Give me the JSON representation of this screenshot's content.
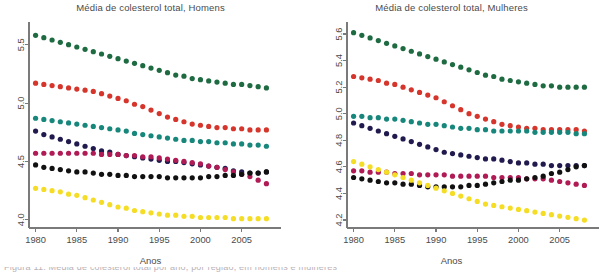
{
  "figure": {
    "background_color": "#ffffff",
    "text_color": "#4a4a4a"
  },
  "footer": {
    "cropped_caption": "Figura 11: Média de colesterol total por ano, por região, em homens e mulheres"
  },
  "panels": {
    "left": {
      "title": "Média de colesterol total, Homens",
      "xlabel": "Anos"
    },
    "right": {
      "title": "Média de colesterol total, Mulheres",
      "xlabel": "Anos"
    }
  },
  "chart_data": [
    {
      "type": "scatter",
      "panel": "left",
      "title": "Média de colesterol total, Homens",
      "xlabel": "Anos",
      "ylabel": "",
      "xlim": [
        1979.2,
        2008.8
      ],
      "ylim": [
        3.93,
        5.66
      ],
      "xticks": [
        1980,
        1985,
        1990,
        1995,
        2000,
        2005
      ],
      "yticks": [
        4.0,
        4.5,
        5.0,
        5.5
      ],
      "grid": false,
      "legend": "none",
      "marker": "filled-circle",
      "x": [
        1980,
        1981,
        1982,
        1983,
        1984,
        1985,
        1986,
        1987,
        1988,
        1989,
        1990,
        1991,
        1992,
        1993,
        1994,
        1995,
        1996,
        1997,
        1998,
        1999,
        2000,
        2001,
        2002,
        2003,
        2004,
        2005,
        2006,
        2007,
        2008
      ],
      "series": [
        {
          "name": "serie-verde-escuro",
          "color": "#1e6b42",
          "values": [
            5.58,
            5.56,
            5.54,
            5.52,
            5.5,
            5.48,
            5.46,
            5.44,
            5.42,
            5.4,
            5.38,
            5.36,
            5.34,
            5.32,
            5.3,
            5.28,
            5.26,
            5.24,
            5.23,
            5.21,
            5.2,
            5.19,
            5.18,
            5.17,
            5.16,
            5.16,
            5.15,
            5.14,
            5.13
          ]
        },
        {
          "name": "serie-vermelho",
          "color": "#d6352b",
          "values": [
            5.17,
            5.16,
            5.15,
            5.14,
            5.13,
            5.12,
            5.11,
            5.1,
            5.08,
            5.06,
            5.04,
            5.02,
            4.99,
            4.97,
            4.94,
            4.91,
            4.88,
            4.86,
            4.84,
            4.82,
            4.81,
            4.8,
            4.79,
            4.79,
            4.78,
            4.78,
            4.77,
            4.77,
            4.77
          ]
        },
        {
          "name": "serie-verde-agua",
          "color": "#17877c",
          "values": [
            4.87,
            4.86,
            4.85,
            4.84,
            4.83,
            4.82,
            4.81,
            4.8,
            4.79,
            4.78,
            4.77,
            4.76,
            4.74,
            4.73,
            4.72,
            4.71,
            4.7,
            4.69,
            4.68,
            4.68,
            4.67,
            4.67,
            4.66,
            4.66,
            4.65,
            4.65,
            4.64,
            4.64,
            4.63
          ]
        },
        {
          "name": "serie-azul-marinho",
          "color": "#211a4e",
          "values": [
            4.76,
            4.73,
            4.71,
            4.69,
            4.67,
            4.65,
            4.63,
            4.61,
            4.59,
            4.58,
            4.56,
            4.55,
            4.54,
            4.53,
            4.52,
            4.51,
            4.5,
            4.5,
            4.49,
            4.48,
            4.47,
            4.46,
            4.45,
            4.44,
            4.42,
            4.41,
            4.4,
            4.4,
            4.41
          ]
        },
        {
          "name": "serie-magenta",
          "color": "#b01b55",
          "values": [
            4.57,
            4.57,
            4.57,
            4.57,
            4.57,
            4.57,
            4.57,
            4.57,
            4.56,
            4.56,
            4.56,
            4.55,
            4.55,
            4.54,
            4.54,
            4.53,
            4.52,
            4.51,
            4.5,
            4.49,
            4.48,
            4.46,
            4.45,
            4.43,
            4.41,
            4.39,
            4.37,
            4.34,
            4.31
          ]
        },
        {
          "name": "serie-preto",
          "color": "#111111",
          "values": [
            4.47,
            4.45,
            4.44,
            4.43,
            4.42,
            4.41,
            4.41,
            4.4,
            4.39,
            4.39,
            4.38,
            4.38,
            4.37,
            4.37,
            4.37,
            4.37,
            4.36,
            4.36,
            4.36,
            4.36,
            4.36,
            4.37,
            4.37,
            4.38,
            4.38,
            4.39,
            4.4,
            4.4,
            4.41
          ]
        },
        {
          "name": "serie-amarelo",
          "color": "#f5dd25",
          "values": [
            4.27,
            4.26,
            4.25,
            4.24,
            4.22,
            4.21,
            4.19,
            4.17,
            4.15,
            4.13,
            4.11,
            4.1,
            4.08,
            4.07,
            4.06,
            4.05,
            4.04,
            4.04,
            4.03,
            4.03,
            4.02,
            4.02,
            4.02,
            4.02,
            4.01,
            4.01,
            4.01,
            4.01,
            4.01
          ]
        }
      ]
    },
    {
      "type": "scatter",
      "panel": "right",
      "title": "Média de colesterol total, Mulheres",
      "xlabel": "Anos",
      "ylabel": "",
      "xlim": [
        1979.2,
        2008.8
      ],
      "ylim": [
        4.14,
        5.66
      ],
      "xticks": [
        1980,
        1985,
        1990,
        1995,
        2000,
        2005
      ],
      "yticks": [
        4.2,
        4.4,
        4.6,
        4.8,
        5.0,
        5.2,
        5.4,
        5.6
      ],
      "grid": false,
      "legend": "none",
      "marker": "filled-circle",
      "x": [
        1980,
        1981,
        1982,
        1983,
        1984,
        1985,
        1986,
        1987,
        1988,
        1989,
        1990,
        1991,
        1992,
        1993,
        1994,
        1995,
        1996,
        1997,
        1998,
        1999,
        2000,
        2001,
        2002,
        2003,
        2004,
        2005,
        2006,
        2007,
        2008
      ],
      "series": [
        {
          "name": "serie-verde-escuro",
          "color": "#1e6b42",
          "values": [
            5.61,
            5.59,
            5.57,
            5.55,
            5.53,
            5.51,
            5.49,
            5.47,
            5.45,
            5.43,
            5.41,
            5.39,
            5.37,
            5.35,
            5.33,
            5.31,
            5.29,
            5.28,
            5.26,
            5.25,
            5.24,
            5.23,
            5.22,
            5.21,
            5.21,
            5.2,
            5.2,
            5.2,
            5.2
          ]
        },
        {
          "name": "serie-vermelho",
          "color": "#d6352b",
          "values": [
            5.28,
            5.27,
            5.26,
            5.25,
            5.23,
            5.22,
            5.2,
            5.18,
            5.16,
            5.14,
            5.12,
            5.09,
            5.06,
            5.03,
            5.0,
            4.98,
            4.96,
            4.94,
            4.92,
            4.91,
            4.9,
            4.89,
            4.89,
            4.88,
            4.88,
            4.88,
            4.88,
            4.88,
            4.87
          ]
        },
        {
          "name": "serie-verde-agua",
          "color": "#17877c",
          "values": [
            4.98,
            4.98,
            4.97,
            4.97,
            4.96,
            4.96,
            4.95,
            4.94,
            4.93,
            4.92,
            4.92,
            4.91,
            4.9,
            4.89,
            4.89,
            4.88,
            4.88,
            4.87,
            4.87,
            4.87,
            4.87,
            4.87,
            4.86,
            4.86,
            4.86,
            4.86,
            4.86,
            4.85,
            4.85
          ]
        },
        {
          "name": "serie-azul-marinho",
          "color": "#211a4e",
          "values": [
            4.93,
            4.91,
            4.89,
            4.87,
            4.85,
            4.83,
            4.81,
            4.79,
            4.77,
            4.75,
            4.73,
            4.71,
            4.7,
            4.69,
            4.68,
            4.67,
            4.66,
            4.66,
            4.65,
            4.64,
            4.63,
            4.63,
            4.62,
            4.62,
            4.61,
            4.61,
            4.61,
            4.61,
            4.61
          ]
        },
        {
          "name": "serie-magenta",
          "color": "#b01b55",
          "values": [
            4.57,
            4.57,
            4.56,
            4.56,
            4.56,
            4.55,
            4.55,
            4.55,
            4.54,
            4.54,
            4.54,
            4.54,
            4.53,
            4.53,
            4.53,
            4.53,
            4.53,
            4.52,
            4.52,
            4.52,
            4.52,
            4.51,
            4.51,
            4.51,
            4.5,
            4.49,
            4.48,
            4.47,
            4.46
          ]
        },
        {
          "name": "serie-preto",
          "color": "#111111",
          "values": [
            4.52,
            4.51,
            4.5,
            4.49,
            4.48,
            4.48,
            4.47,
            4.47,
            4.46,
            4.45,
            4.45,
            4.45,
            4.45,
            4.45,
            4.46,
            4.46,
            4.47,
            4.48,
            4.49,
            4.5,
            4.5,
            4.51,
            4.52,
            4.53,
            4.55,
            4.56,
            4.58,
            4.6,
            4.61
          ]
        },
        {
          "name": "serie-amarelo",
          "color": "#f5dd25",
          "values": [
            4.64,
            4.62,
            4.6,
            4.58,
            4.56,
            4.54,
            4.52,
            4.5,
            4.48,
            4.46,
            4.44,
            4.42,
            4.4,
            4.38,
            4.36,
            4.34,
            4.32,
            4.31,
            4.3,
            4.29,
            4.28,
            4.27,
            4.26,
            4.25,
            4.24,
            4.23,
            4.22,
            4.21,
            4.2
          ]
        }
      ]
    }
  ]
}
